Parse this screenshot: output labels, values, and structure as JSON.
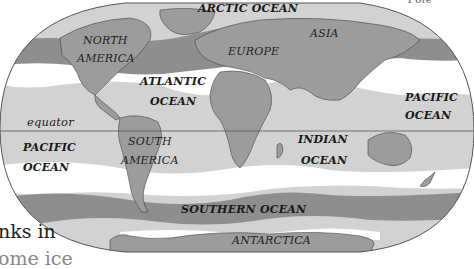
{
  "map": {
    "type": "world-ocean-map",
    "projection": "elliptical",
    "colors": {
      "background": "#ffffff",
      "ocean_light": "#d2d2d2",
      "ocean_white": "#ffffff",
      "band_dark": "#8e8e8e",
      "land": "#9c9c9c",
      "outline": "#444444"
    },
    "labels": {
      "arctic_ocean": "ARCTIC OCEAN",
      "north_america_1": "NORTH",
      "north_america_2": "AMERICA",
      "europe": "EUROPE",
      "asia": "ASIA",
      "atlantic_1": "ATLANTIC",
      "atlantic_2": "OCEAN",
      "pacific_east_1": "PACIFIC",
      "pacific_east_2": "OCEAN",
      "equator": "equator",
      "pacific_west_1": "PACIFIC",
      "pacific_west_2": "OCEAN",
      "south_america_1": "SOUTH",
      "south_america_2": "AMERICA",
      "indian_1": "INDIAN",
      "indian_2": "OCEAN",
      "southern_ocean": "SOUTHERN OCEAN",
      "antarctica": "ANTARCTICA"
    },
    "fragments": {
      "top_right": "Pole",
      "left_line1": "nks in",
      "left_line2": "ome ice"
    }
  }
}
